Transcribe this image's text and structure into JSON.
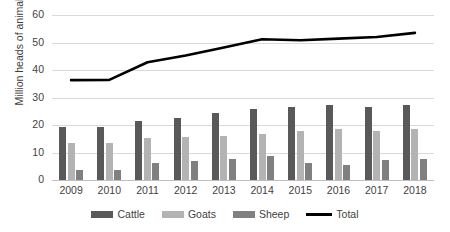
{
  "chart_data": {
    "type": "bar",
    "title": "",
    "xlabel": "",
    "ylabel": "Million heads of animal",
    "categories": [
      "2009",
      "2010",
      "2011",
      "2012",
      "2013",
      "2014",
      "2015",
      "2016",
      "2017",
      "2018"
    ],
    "ylim": [
      0,
      60
    ],
    "yticks": [
      0,
      10,
      20,
      30,
      40,
      50,
      60
    ],
    "grid": true,
    "legend_position": "bottom",
    "series": [
      {
        "name": "Cattle",
        "type": "bar",
        "color": "#595959",
        "values": [
          19.1,
          19.2,
          21.3,
          22.7,
          24.5,
          25.8,
          26.7,
          27.1,
          26.7,
          27.3
        ]
      },
      {
        "name": "Goats",
        "type": "bar",
        "color": "#b3b3b3",
        "values": [
          13.5,
          13.5,
          15.2,
          15.6,
          16.1,
          16.7,
          18.0,
          18.7,
          18.0,
          18.4
        ]
      },
      {
        "name": "Sheep",
        "type": "bar",
        "color": "#808080",
        "values": [
          3.5,
          3.5,
          6.2,
          7.0,
          7.7,
          8.7,
          6.1,
          5.4,
          7.2,
          7.8
        ]
      },
      {
        "name": "Total",
        "type": "line",
        "color": "#000000",
        "values": [
          36.3,
          36.4,
          42.8,
          45.3,
          48.2,
          51.2,
          50.8,
          51.4,
          52.0,
          53.5
        ]
      }
    ]
  },
  "axis": {
    "y_tick_labels": [
      "0",
      "10",
      "20",
      "30",
      "40",
      "50",
      "60"
    ],
    "y_title": "Million heads of animal"
  },
  "legend": {
    "items": [
      {
        "label": "Cattle",
        "marker": "bar-swatch-dark"
      },
      {
        "label": "Goats",
        "marker": "bar-swatch-light"
      },
      {
        "label": "Sheep",
        "marker": "bar-swatch-mid"
      },
      {
        "label": "Total",
        "marker": "line-swatch-black"
      }
    ]
  }
}
